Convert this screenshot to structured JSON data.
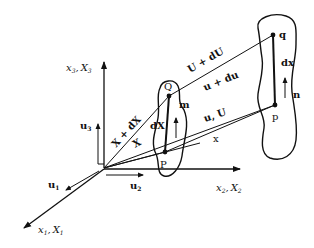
{
  "diagram": {
    "type": "continuum-deformation-kinematics",
    "axes": {
      "x1": {
        "label": "x",
        "sub": "1",
        "label2": "X",
        "sub2": "1"
      },
      "x2": {
        "label": "x",
        "sub": "2",
        "label2": "X",
        "sub2": "2"
      },
      "x3": {
        "label": "x",
        "sub": "3",
        "label2": "X",
        "sub2": "3"
      },
      "separator": ","
    },
    "unit_vectors": {
      "u1": {
        "label": "u",
        "sub": "1"
      },
      "u2": {
        "label": "u",
        "sub": "2"
      },
      "u3": {
        "label": "u",
        "sub": "3"
      }
    },
    "undeformed": {
      "point_P": "P",
      "point_Q": "Q",
      "normal": "m",
      "element": "dX"
    },
    "deformed": {
      "point_p": "p",
      "point_q": "q",
      "normal": "n",
      "element": "dx"
    },
    "vectors": {
      "X": "X",
      "X_plus_dX": "X + dX",
      "x": "x",
      "u_U": "u, U",
      "u_plus_du": "u + du",
      "U_plus_dU": "U + dU"
    },
    "color": "#111111"
  }
}
